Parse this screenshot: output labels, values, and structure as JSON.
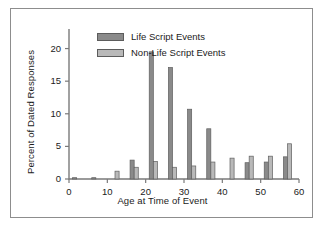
{
  "figure": {
    "background_color": "#ffffff",
    "frame_color": "#8d8d8d"
  },
  "legend": {
    "position": "top-left-inside",
    "entries": [
      {
        "label": "Life Script Events",
        "color": "#8a8a8a"
      },
      {
        "label": "Non-Life Script Events",
        "color": "#b9b9b9"
      }
    ]
  },
  "chart_data": {
    "type": "bar",
    "title": "",
    "subtitle": "",
    "xlabel": "Age at Time of Event",
    "ylabel": "Percent of Dated Responses",
    "xlim": [
      0,
      60
    ],
    "ylim": [
      0,
      23
    ],
    "xticks": [
      0,
      10,
      20,
      30,
      40,
      50,
      60
    ],
    "yticks": [
      0,
      5,
      10,
      15,
      20
    ],
    "xtick_labels": [
      "0",
      "10",
      "20",
      "30",
      "40",
      "50",
      "60"
    ],
    "ytick_labels": [
      "0",
      "5",
      "10",
      "15",
      "20"
    ],
    "grid": false,
    "legend_position": "upper left",
    "x": [
      2,
      7,
      12,
      17,
      22,
      27,
      32,
      37,
      42,
      47,
      52,
      57
    ],
    "categories": [
      "2",
      "7",
      "12",
      "17",
      "22",
      "27",
      "32",
      "37",
      "42",
      "47",
      "52",
      "57"
    ],
    "series": [
      {
        "name": "Life Script Events",
        "color": "#8a8a8a",
        "values": [
          0.2,
          0.2,
          0.0,
          2.9,
          19.5,
          17.1,
          10.7,
          7.7,
          0.0,
          2.5,
          2.6,
          3.4
        ]
      },
      {
        "name": "Non-Life Script Events",
        "color": "#b9b9b9",
        "values": [
          0.0,
          0.0,
          1.2,
          1.8,
          2.7,
          1.8,
          2.0,
          2.6,
          3.2,
          3.5,
          3.5,
          5.4
        ]
      }
    ],
    "annotations": []
  }
}
